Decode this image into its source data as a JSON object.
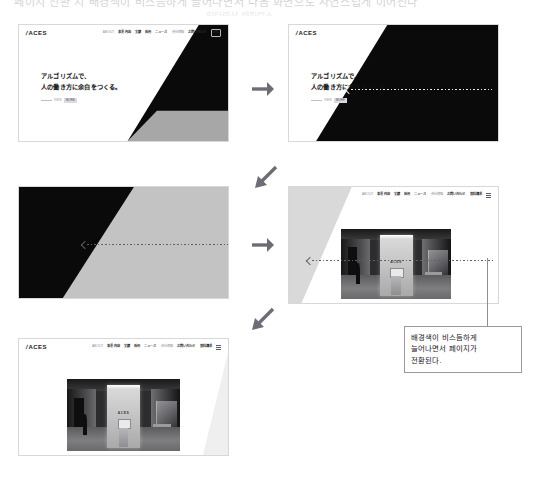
{
  "document": {
    "title": "ACES website page-transition storyboard",
    "top_strip_text": "페이지 전환 시 배경색이 비스듬하게 늘어나면서 다음 화면으로 자연스럽게 이어진다",
    "top_strip_subtext": "인터랙션 레퍼런스"
  },
  "site": {
    "logo_mark": "/",
    "logo_text": "ACES",
    "nav_items": [
      {
        "label": "ABOUT",
        "style": "muted"
      },
      {
        "label": "事業内容",
        "style": "bold"
      },
      {
        "label": "実績",
        "style": "bold"
      },
      {
        "label": "採用",
        "style": "bold"
      },
      {
        "label": "ニュース",
        "style": "bold"
      },
      {
        "label": "会社情報",
        "style": "muted"
      },
      {
        "label": "お問い合わせ",
        "style": "bold"
      },
      {
        "label": "資料請求",
        "style": "bold"
      }
    ],
    "nav_cta_label": "EN",
    "nav_menu_icon": "hamburger-icon"
  },
  "hero": {
    "line1": "アルゴリズムで、",
    "line2": "人の働き方に余白をつくる。",
    "sub_label": "VIEW",
    "sub_chip": "MORE"
  },
  "photo": {
    "alt_name": "office-lobby-photo",
    "sign_text": "ACES"
  },
  "panels": [
    {
      "id": "panel-1",
      "name": "state-1-initial-hero",
      "caption": "初期状態 — 白背景のヒーロー、右に黒のディアゴナル"
    },
    {
      "id": "panel-2",
      "name": "state-2-black-sweeps-left",
      "caption": "黒背景が左へ伸びる"
    },
    {
      "id": "panel-3",
      "name": "state-3-gray-replaces-black",
      "caption": "グレーが右から入れ替わる"
    },
    {
      "id": "panel-4",
      "name": "state-4-photo-reveals",
      "caption": "次ページの写真が現れる"
    },
    {
      "id": "panel-5",
      "name": "state-5-final-page",
      "caption": "遷移完了 — 次ページ表示"
    }
  ],
  "flow_arrows": [
    {
      "name": "arrow-panel1-to-panel2",
      "direction": "right",
      "glyph": "→"
    },
    {
      "name": "arrow-panel2-to-panel3",
      "direction": "down-left",
      "glyph": "↙"
    },
    {
      "name": "arrow-panel3-to-panel4",
      "direction": "right",
      "glyph": "→"
    },
    {
      "name": "arrow-panel4-to-panel5",
      "direction": "down-left",
      "glyph": "↙"
    }
  ],
  "motion_arrows": [
    {
      "name": "motion-arrow-panel2",
      "direction": "left",
      "style": "dotted"
    },
    {
      "name": "motion-arrow-panel3",
      "direction": "left",
      "style": "dotted"
    },
    {
      "name": "motion-arrow-panel4",
      "direction": "left",
      "style": "dotted"
    }
  ],
  "annotation": {
    "name": "transition-annotation",
    "text": "배경색이 비스듬하게 늘어나면서 페이지가 전환된다.",
    "line1": "배경색이 비스듬하게",
    "line2": "늘어나면서 페이지가",
    "line3": "전환된다."
  },
  "colors": {
    "page_background": "#ffffff",
    "panel_border": "#d8d8dc",
    "diagonal_black": "#0a0a0a",
    "diagonal_gray": "#c3c3c3",
    "diagonal_light_gray": "#d7d7d7",
    "text_primary": "#111111",
    "text_muted": "#8f8f97",
    "arrow_gray": "#6d6d75",
    "annotation_border": "#9a9aa2"
  }
}
